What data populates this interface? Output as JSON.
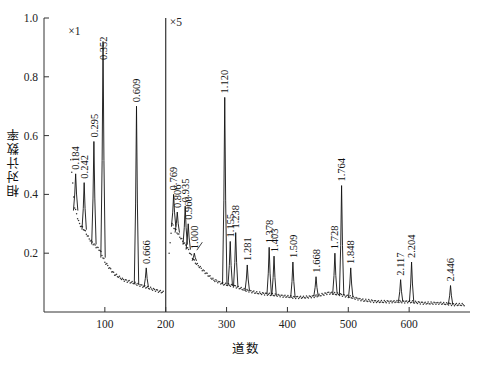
{
  "chart_data": {
    "type": "line",
    "title": "",
    "xlabel": "道数",
    "ylabel": "相对计数率",
    "xlim": [
      0,
      700
    ],
    "ylim": [
      0,
      1.0
    ],
    "xticks": [
      100,
      200,
      300,
      400,
      500,
      600
    ],
    "yticks": [
      "0.2",
      "0.4",
      "0.6",
      "0.8",
      "1.0"
    ],
    "ytick_values": [
      0.2,
      0.4,
      0.6,
      0.8,
      1.0
    ],
    "grid": false,
    "legend": null,
    "annotations": [
      {
        "text": "×1",
        "x": 40,
        "y": 0.95,
        "note": "left panel vertical scale factor"
      },
      {
        "text": "×5",
        "x": 205,
        "y": 0.98,
        "note": "right panel vertical scale factor"
      }
    ],
    "panel_divider_x": 200,
    "series": [
      {
        "name": "gamma spectrum",
        "peaks": [
          {
            "label": "0.184",
            "channel": 52,
            "height": 0.47
          },
          {
            "label": "0.242",
            "channel": 66,
            "height": 0.44
          },
          {
            "label": "0.295",
            "channel": 82,
            "height": 0.58
          },
          {
            "label": "0.352",
            "channel": 97,
            "height": 0.92
          },
          {
            "label": "0.609",
            "channel": 152,
            "height": 0.7
          },
          {
            "label": "0.666",
            "channel": 168,
            "height": 0.15
          },
          {
            "label": "0.769",
            "channel": 213,
            "height": 0.4
          },
          {
            "label": "0.806",
            "channel": 219,
            "height": 0.34
          },
          {
            "label": "0.935",
            "channel": 232,
            "height": 0.36
          },
          {
            "label": "0.960",
            "channel": 237,
            "height": 0.3
          },
          {
            "label": "1.000",
            "channel": 247,
            "height": 0.2
          },
          {
            "label": "1.120",
            "channel": 297,
            "height": 0.73
          },
          {
            "label": "1.155",
            "channel": 306,
            "height": 0.24
          },
          {
            "label": "1.238",
            "channel": 315,
            "height": 0.27
          },
          {
            "label": "1.281",
            "channel": 334,
            "height": 0.16
          },
          {
            "label": "1.378",
            "channel": 370,
            "height": 0.22
          },
          {
            "label": "1.403",
            "channel": 378,
            "height": 0.19
          },
          {
            "label": "1.509",
            "channel": 409,
            "height": 0.17
          },
          {
            "label": "1.668",
            "channel": 447,
            "height": 0.12
          },
          {
            "label": "1.728",
            "channel": 478,
            "height": 0.2
          },
          {
            "label": "1.764",
            "channel": 489,
            "height": 0.43
          },
          {
            "label": "1.848",
            "channel": 504,
            "height": 0.15
          },
          {
            "label": "2.117",
            "channel": 586,
            "height": 0.11
          },
          {
            "label": "2.204",
            "channel": 604,
            "height": 0.17
          },
          {
            "label": "2.446",
            "channel": 668,
            "height": 0.09
          }
        ],
        "continuum": [
          {
            "channel": 44,
            "value": 0.52
          },
          {
            "channel": 50,
            "value": 0.36
          },
          {
            "channel": 58,
            "value": 0.3
          },
          {
            "channel": 66,
            "value": 0.28
          },
          {
            "channel": 74,
            "value": 0.25
          },
          {
            "channel": 82,
            "value": 0.23
          },
          {
            "channel": 92,
            "value": 0.21
          },
          {
            "channel": 100,
            "value": 0.17
          },
          {
            "channel": 115,
            "value": 0.13
          },
          {
            "channel": 130,
            "value": 0.11
          },
          {
            "channel": 145,
            "value": 0.1
          },
          {
            "channel": 160,
            "value": 0.09
          },
          {
            "channel": 175,
            "value": 0.08
          },
          {
            "channel": 190,
            "value": 0.07
          },
          {
            "channel": 200,
            "value": 0.065
          },
          {
            "channel": 210,
            "value": 0.3
          },
          {
            "channel": 222,
            "value": 0.26
          },
          {
            "channel": 235,
            "value": 0.22
          },
          {
            "channel": 248,
            "value": 0.17
          },
          {
            "channel": 262,
            "value": 0.14
          },
          {
            "channel": 278,
            "value": 0.11
          },
          {
            "channel": 295,
            "value": 0.095
          },
          {
            "channel": 310,
            "value": 0.09
          },
          {
            "channel": 330,
            "value": 0.075
          },
          {
            "channel": 350,
            "value": 0.065
          },
          {
            "channel": 370,
            "value": 0.06
          },
          {
            "channel": 390,
            "value": 0.055
          },
          {
            "channel": 410,
            "value": 0.05
          },
          {
            "channel": 430,
            "value": 0.05
          },
          {
            "channel": 450,
            "value": 0.055
          },
          {
            "channel": 468,
            "value": 0.065
          },
          {
            "channel": 485,
            "value": 0.06
          },
          {
            "channel": 505,
            "value": 0.05
          },
          {
            "channel": 525,
            "value": 0.04
          },
          {
            "channel": 550,
            "value": 0.035
          },
          {
            "channel": 575,
            "value": 0.035
          },
          {
            "channel": 600,
            "value": 0.035
          },
          {
            "channel": 625,
            "value": 0.03
          },
          {
            "channel": 650,
            "value": 0.03
          },
          {
            "channel": 675,
            "value": 0.025
          },
          {
            "channel": 690,
            "value": 0.025
          }
        ]
      }
    ]
  }
}
